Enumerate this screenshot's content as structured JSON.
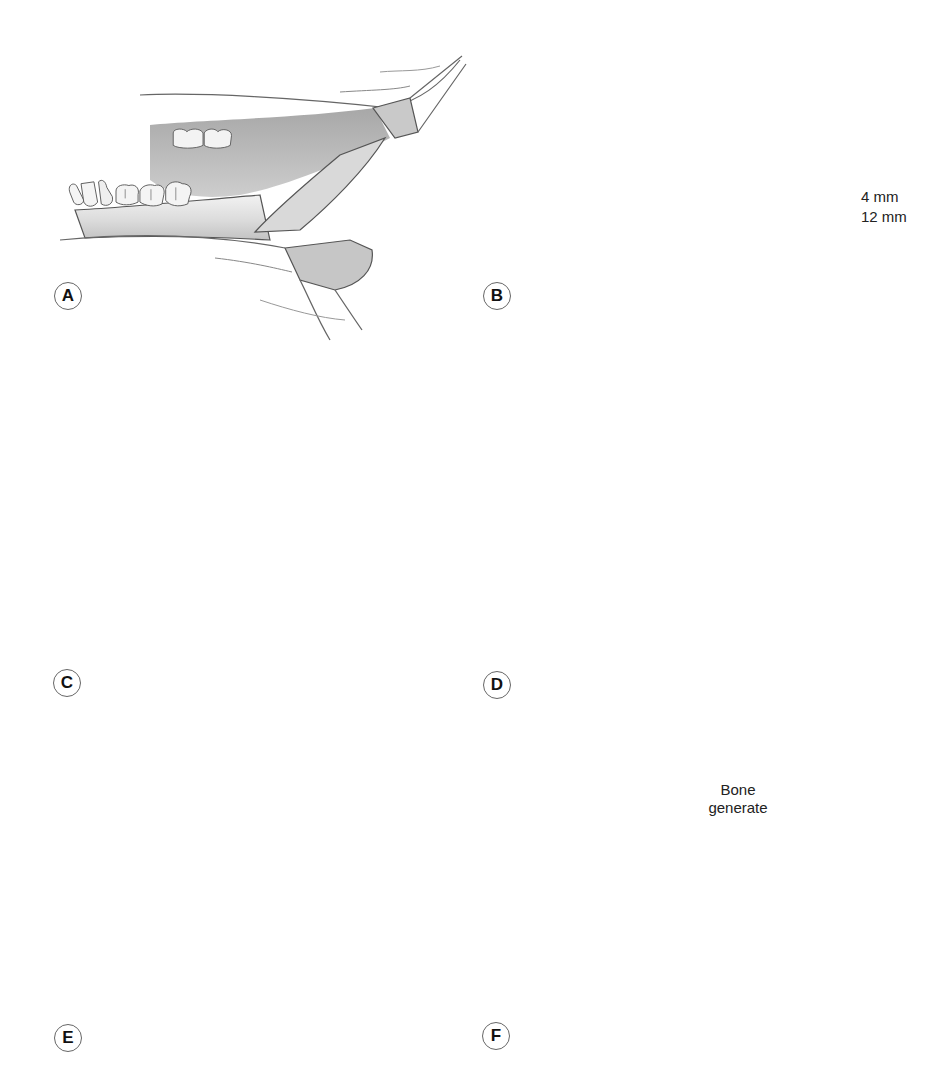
{
  "figure": {
    "panels": [
      {
        "id": "A",
        "label": "A",
        "description": "Intraoral incision exposing mandible with retractors"
      },
      {
        "id": "B",
        "label": "B",
        "description": "Osteotomy line marked; pin sites at 4 mm and 12 mm spacing; first pin being placed"
      },
      {
        "id": "C",
        "label": "C",
        "description": "Four pins placed on either side of osteotomy line"
      },
      {
        "id": "D",
        "label": "D",
        "description": "Corticotomy performed with rotary instrument"
      },
      {
        "id": "E",
        "label": "E",
        "description": "External distraction device attached to pins"
      },
      {
        "id": "F",
        "label": "F",
        "description": "Distraction completed with regenerate bone in gap"
      }
    ],
    "annotations": {
      "measure_small": "4 mm",
      "measure_large": "12 mm",
      "regenerate_line1": "Bone",
      "regenerate_line2": "generate"
    },
    "colors": {
      "bone_fill": "#e6e6e6",
      "bone_shadow": "#bdbdbd",
      "outline": "#3a3a3a",
      "dashed_line": "#111111",
      "pin_fill": "#cfcfcf",
      "device_fill": "#d4d4d4",
      "regenerate_fill": "#9a9a9a"
    }
  }
}
